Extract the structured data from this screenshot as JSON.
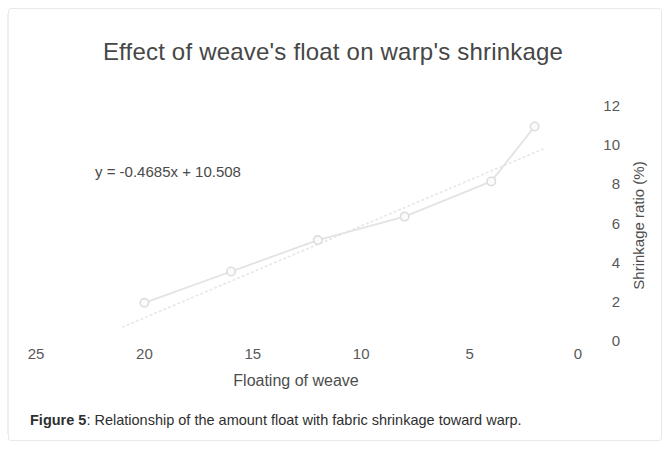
{
  "figure": {
    "caption_label": "Figure 5",
    "caption_separator": ":",
    "caption_text": " Relationship of the amount float with fabric shrinkage toward warp."
  },
  "chart_data": {
    "type": "scatter",
    "title": "Effect of weave's float on warp's shrinkage",
    "xlabel": "Floating of weave",
    "ylabel": "Shrinkage ratio (%)",
    "xlim": [
      25,
      0
    ],
    "ylim": [
      0,
      12
    ],
    "x_ticks": [
      "25",
      "20",
      "15",
      "10",
      "5",
      "0"
    ],
    "x_tick_values": [
      25,
      20,
      15,
      10,
      5,
      0
    ],
    "y_ticks": [
      "0",
      "2",
      "4",
      "6",
      "8",
      "10",
      "12"
    ],
    "y_tick_values": [
      0,
      2,
      4,
      6,
      8,
      10,
      12
    ],
    "x_axis_reversed": true,
    "y_axis_position": "right",
    "grid": false,
    "legend": false,
    "series": [
      {
        "name": "Shrinkage ratio",
        "marker": "circle",
        "line_style": "solid",
        "color": "#e3e3e6",
        "x": [
          20,
          16,
          12,
          8,
          4,
          2
        ],
        "values": [
          1.9,
          3.5,
          5.1,
          6.3,
          8.1,
          10.9
        ]
      },
      {
        "name": "Linear trendline",
        "marker": "none",
        "line_style": "dotted",
        "color": "#e6e6e8",
        "equation": "y = -0.4685x + 10.508",
        "slope": -0.4685,
        "intercept": 10.508,
        "x": [
          21,
          1.5
        ],
        "values": [
          0.6655,
          9.80525
        ]
      }
    ],
    "annotations": [
      {
        "name": "trendline-equation",
        "text": "y = -0.4685x + 10.508",
        "x_px": 95,
        "y_px": 163
      }
    ]
  },
  "colors": {
    "title": "#474747",
    "tick": "#595959",
    "axis_title": "#4d4d4d",
    "series_line": "#e3e3e6",
    "trend_line": "#e6e6e8",
    "marker_stroke": "#dddde0",
    "caption": "#2f2f2f",
    "page_border": "#e9e9e9",
    "background": "#ffffff"
  }
}
